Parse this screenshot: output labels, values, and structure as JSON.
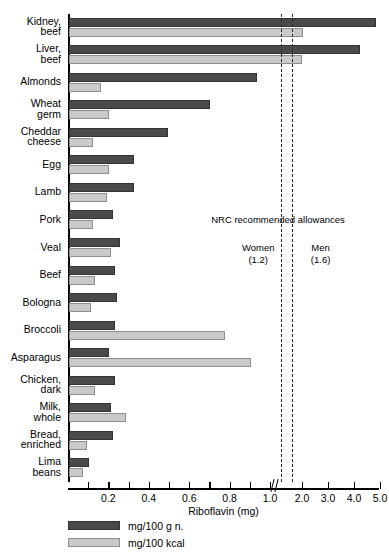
{
  "chart_data": {
    "type": "bar",
    "orientation": "horizontal",
    "title": "",
    "xlabel": "Riboflavin (mg)",
    "ylabel": "",
    "grid": false,
    "legend_position": "bottom-left",
    "axis_note": "Axis scale is broken after 1.0 mg; region above 1.0 is compressed.",
    "xticks": [
      "0.2",
      "0.4",
      "0.6",
      "0.8",
      "1.0",
      "2.0",
      "3.0",
      "4.0",
      "5.0"
    ],
    "xtick_values": [
      0.2,
      0.4,
      0.6,
      0.8,
      1.0,
      2.0,
      3.0,
      4.0,
      5.0
    ],
    "xlim": [
      0,
      5.2
    ],
    "categories": [
      "Kidney,\nbeef",
      "Liver,\nbeef",
      "Almonds",
      "Wheat\ngerm",
      "Cheddar\ncheese",
      "Egg",
      "Lamb",
      "Pork",
      "Veal",
      "Beef",
      "Bologna",
      "Broccoli",
      "Asparagus",
      "Chicken,\ndark",
      "Milk,\nwhole",
      "Bread,\nenriched",
      "Lima\nbeans"
    ],
    "series": [
      {
        "name": "mg/100 g n.",
        "color": "#4a4a4a",
        "values": [
          4.8,
          4.2,
          0.93,
          0.7,
          0.49,
          0.32,
          0.32,
          0.22,
          0.25,
          0.23,
          0.24,
          0.23,
          0.2,
          0.23,
          0.21,
          0.22,
          0.1
        ]
      },
      {
        "name": "mg/100 kcal",
        "color": "#c9c9c9",
        "values": [
          2.0,
          1.95,
          0.16,
          0.2,
          0.12,
          0.2,
          0.19,
          0.12,
          0.21,
          0.13,
          0.11,
          0.77,
          0.9,
          0.13,
          0.28,
          0.09,
          0.07
        ]
      }
    ],
    "reference_lines": [
      {
        "label": "Women",
        "value_text": "(1.2)",
        "value": 1.2
      },
      {
        "label": "Men",
        "value_text": "(1.6)",
        "value": 1.6
      }
    ],
    "annotations": {
      "nrc_title": "NRC recommended allowances"
    }
  },
  "legend": {
    "items": [
      {
        "label": "mg/100 g n.",
        "swatch": "dark"
      },
      {
        "label": "mg/100 kcal",
        "swatch": "light"
      }
    ]
  }
}
